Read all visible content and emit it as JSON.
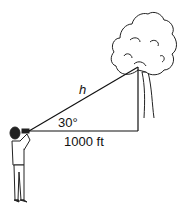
{
  "diagram": {
    "labels": {
      "hypotenuse": "h",
      "angle": "30°",
      "base": "1000 ft"
    },
    "colors": {
      "stroke": "#111111",
      "background": "#ffffff"
    }
  }
}
